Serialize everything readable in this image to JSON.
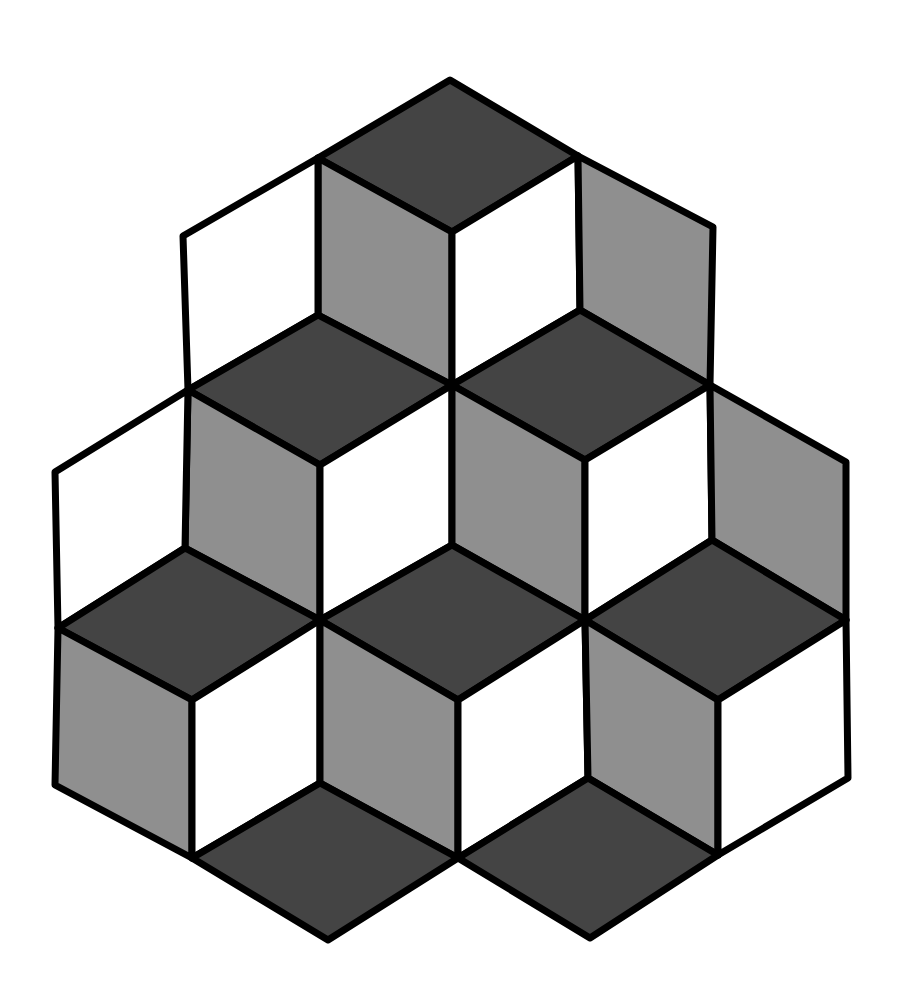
{
  "figure": {
    "title": "Isometric stacked cubes illusion",
    "width": 900,
    "height": 993,
    "background": "#ffffff",
    "stroke_color": "#000000",
    "stroke_width": 7,
    "colors": {
      "dark": "#444444",
      "mid": "#8f8f8f",
      "light": "#ffffff"
    },
    "faces": [
      {
        "name": "top-cube-top-face",
        "shade": "dark",
        "points": [
          [
            450,
            80
          ],
          [
            578,
            156
          ],
          [
            452,
            232
          ],
          [
            318,
            158
          ]
        ]
      },
      {
        "name": "top-cube-left-face",
        "shade": "mid",
        "points": [
          [
            318,
            158
          ],
          [
            452,
            232
          ],
          [
            452,
            385
          ],
          [
            318,
            315
          ]
        ]
      },
      {
        "name": "top-cube-right-face",
        "shade": "light",
        "points": [
          [
            452,
            232
          ],
          [
            578,
            156
          ],
          [
            580,
            310
          ],
          [
            452,
            385
          ]
        ]
      },
      {
        "name": "top-right-gray-face",
        "shade": "mid",
        "points": [
          [
            578,
            156
          ],
          [
            713,
            227
          ],
          [
            710,
            385
          ],
          [
            580,
            310
          ]
        ]
      },
      {
        "name": "top-left-white-face",
        "shade": "light",
        "points": [
          [
            183,
            236
          ],
          [
            318,
            158
          ],
          [
            318,
            315
          ],
          [
            188,
            390
          ]
        ]
      },
      {
        "name": "upper-left-cube-top-face",
        "shade": "dark",
        "points": [
          [
            318,
            315
          ],
          [
            452,
            385
          ],
          [
            320,
            465
          ],
          [
            188,
            390
          ]
        ]
      },
      {
        "name": "upper-left-cube-left-face",
        "shade": "mid",
        "points": [
          [
            188,
            390
          ],
          [
            320,
            465
          ],
          [
            320,
            620
          ],
          [
            185,
            548
          ]
        ]
      },
      {
        "name": "upper-left-cube-right-face",
        "shade": "light",
        "points": [
          [
            320,
            465
          ],
          [
            452,
            385
          ],
          [
            452,
            545
          ],
          [
            320,
            620
          ]
        ]
      },
      {
        "name": "far-left-white-face",
        "shade": "light",
        "points": [
          [
            55,
            472
          ],
          [
            188,
            390
          ],
          [
            185,
            548
          ],
          [
            58,
            628
          ]
        ]
      },
      {
        "name": "upper-right-cube-top-face",
        "shade": "dark",
        "points": [
          [
            580,
            310
          ],
          [
            710,
            385
          ],
          [
            585,
            460
          ],
          [
            452,
            385
          ]
        ]
      },
      {
        "name": "upper-right-cube-left-face",
        "shade": "mid",
        "points": [
          [
            452,
            385
          ],
          [
            585,
            460
          ],
          [
            585,
            620
          ],
          [
            452,
            545
          ]
        ]
      },
      {
        "name": "upper-right-cube-right-face",
        "shade": "light",
        "points": [
          [
            585,
            460
          ],
          [
            710,
            385
          ],
          [
            712,
            540
          ],
          [
            585,
            620
          ]
        ]
      },
      {
        "name": "far-right-gray-face",
        "shade": "mid",
        "points": [
          [
            710,
            385
          ],
          [
            846,
            462
          ],
          [
            846,
            620
          ],
          [
            712,
            540
          ]
        ]
      },
      {
        "name": "lower-left-cube-top-face",
        "shade": "dark",
        "points": [
          [
            185,
            548
          ],
          [
            320,
            620
          ],
          [
            192,
            700
          ],
          [
            58,
            628
          ]
        ]
      },
      {
        "name": "lower-left-cube-left-face",
        "shade": "mid",
        "points": [
          [
            58,
            628
          ],
          [
            192,
            700
          ],
          [
            192,
            858
          ],
          [
            55,
            785
          ]
        ]
      },
      {
        "name": "lower-left-cube-right-face",
        "shade": "light",
        "points": [
          [
            192,
            700
          ],
          [
            320,
            620
          ],
          [
            320,
            783
          ],
          [
            192,
            858
          ]
        ]
      },
      {
        "name": "lower-middle-cube-top-face",
        "shade": "dark",
        "points": [
          [
            452,
            545
          ],
          [
            585,
            620
          ],
          [
            458,
            700
          ],
          [
            320,
            620
          ]
        ]
      },
      {
        "name": "lower-middle-cube-left-face",
        "shade": "mid",
        "points": [
          [
            320,
            620
          ],
          [
            458,
            700
          ],
          [
            458,
            858
          ],
          [
            320,
            783
          ]
        ]
      },
      {
        "name": "lower-middle-cube-right-face",
        "shade": "light",
        "points": [
          [
            458,
            700
          ],
          [
            585,
            620
          ],
          [
            588,
            778
          ],
          [
            458,
            858
          ]
        ]
      },
      {
        "name": "lower-right-cube-top-face",
        "shade": "dark",
        "points": [
          [
            712,
            540
          ],
          [
            846,
            620
          ],
          [
            718,
            700
          ],
          [
            585,
            620
          ]
        ]
      },
      {
        "name": "lower-right-cube-left-face",
        "shade": "mid",
        "points": [
          [
            585,
            620
          ],
          [
            718,
            700
          ],
          [
            718,
            855
          ],
          [
            588,
            778
          ]
        ]
      },
      {
        "name": "lower-right-cube-right-face",
        "shade": "light",
        "points": [
          [
            718,
            700
          ],
          [
            846,
            620
          ],
          [
            848,
            778
          ],
          [
            718,
            855
          ]
        ]
      },
      {
        "name": "bottom-left-floor-diamond",
        "shade": "dark",
        "points": [
          [
            320,
            783
          ],
          [
            458,
            858
          ],
          [
            328,
            940
          ],
          [
            192,
            858
          ]
        ]
      },
      {
        "name": "bottom-right-floor-diamond",
        "shade": "dark",
        "points": [
          [
            588,
            778
          ],
          [
            718,
            855
          ],
          [
            590,
            938
          ],
          [
            458,
            858
          ]
        ]
      }
    ]
  }
}
